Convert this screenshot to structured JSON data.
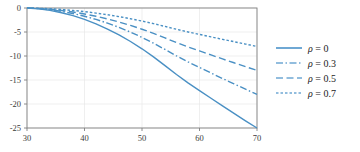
{
  "chart_data": {
    "type": "line",
    "title": "",
    "xlabel": "",
    "ylabel": "",
    "xlim": [
      30,
      70
    ],
    "ylim": [
      -25,
      0
    ],
    "xticks": [
      30,
      40,
      50,
      60,
      70
    ],
    "yticks": [
      0,
      -5,
      -10,
      -15,
      -20,
      -25
    ],
    "xticklabels": [
      "30",
      "40",
      "50",
      "60",
      "70"
    ],
    "yticklabels": [
      "0",
      "-5",
      "-10",
      "-15",
      "-20",
      "-25"
    ],
    "grid": true,
    "legend_position": "right",
    "line_color": "#4a90c4",
    "legend_swatch_color": "#6fa8d4",
    "axis_color": "#808080",
    "grid_color": "#e8e8e8",
    "x": [
      30,
      32,
      34,
      36,
      38,
      40,
      42,
      44,
      46,
      48,
      50,
      52,
      54,
      56,
      58,
      60,
      62,
      64,
      66,
      68,
      70
    ],
    "series": [
      {
        "name": "rho = 0",
        "label": "ρ = 0",
        "style": "solid",
        "dasharray": "",
        "values": [
          0,
          -0.18,
          -0.5,
          -0.98,
          -1.6,
          -2.38,
          -3.3,
          -4.38,
          -5.6,
          -6.98,
          -8.5,
          -10.18,
          -12.0,
          -13.85,
          -15.6,
          -17.2,
          -18.8,
          -20.4,
          -21.95,
          -23.5,
          -25.0
        ]
      },
      {
        "name": "rho = 0.3",
        "label": "ρ = 0.3",
        "style": "dashdot",
        "dasharray": "7,2.5,1.5,2.5",
        "values": [
          0,
          -0.13,
          -0.36,
          -0.71,
          -1.15,
          -1.71,
          -2.38,
          -3.15,
          -4.03,
          -5.02,
          -6.12,
          -7.33,
          -8.64,
          -9.97,
          -11.23,
          -12.38,
          -13.54,
          -14.69,
          -15.8,
          -16.92,
          -18.0
        ]
      },
      {
        "name": "rho = 0.5",
        "label": "ρ = 0.5",
        "style": "dashed",
        "dasharray": "7,3.5",
        "values": [
          0,
          -0.09,
          -0.26,
          -0.51,
          -0.83,
          -1.24,
          -1.72,
          -2.28,
          -2.91,
          -3.63,
          -4.42,
          -5.29,
          -6.24,
          -7.2,
          -8.11,
          -8.94,
          -9.78,
          -10.61,
          -11.41,
          -12.22,
          -13.0
        ]
      },
      {
        "name": "rho = 0.7",
        "label": "ρ = 0.7",
        "style": "dotted",
        "dasharray": "2.5,2",
        "values": [
          0,
          -0.06,
          -0.16,
          -0.31,
          -0.51,
          -0.76,
          -1.06,
          -1.4,
          -1.79,
          -2.23,
          -2.72,
          -3.26,
          -3.84,
          -4.43,
          -4.99,
          -5.5,
          -6.02,
          -6.53,
          -7.02,
          -7.52,
          -8.0
        ]
      }
    ]
  }
}
